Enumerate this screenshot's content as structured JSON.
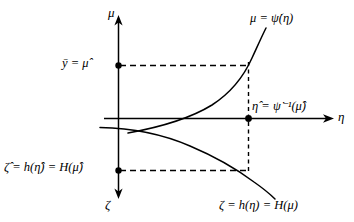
{
  "figure": {
    "background_color": "#ffffff",
    "line_color": "#000000"
  },
  "axes": {
    "vertical_up": {
      "label": "μ",
      "name": "mu-axis",
      "direction": "up"
    },
    "horizontal_right": {
      "label": "η",
      "name": "eta-axis",
      "direction": "right"
    },
    "vertical_down": {
      "label": "ζ",
      "name": "zeta-axis",
      "direction": "down"
    }
  },
  "curves": [
    {
      "name": "upper-curve",
      "label": "μ = ψ̇(η)",
      "description": "increasing convex curve in upper half plane"
    },
    {
      "name": "lower-curve",
      "label": "ζ = h(η) = H(μ)",
      "description": "decreasing concave curve in lower half plane"
    }
  ],
  "annotations": {
    "mu_hat_tick": "ȳ = μ̂",
    "eta_hat_point": "η̂ = ψ̇⁻¹(μ̂)",
    "zeta_hat_tick": "ζ̂ = h(η̂) = H(μ̂)"
  },
  "markers": [
    {
      "name": "mu-hat-marker",
      "x": 118,
      "y": 65
    },
    {
      "name": "eta-hat-marker",
      "x": 248,
      "y": 118
    },
    {
      "name": "zeta-hat-marker",
      "x": 118,
      "y": 170
    }
  ],
  "guide_lines": [
    {
      "name": "upper-horizontal-dashed",
      "from": [
        118,
        65
      ],
      "to": [
        248,
        65
      ]
    },
    {
      "name": "lower-horizontal-dashed",
      "from": [
        118,
        170
      ],
      "to": [
        248,
        170
      ]
    },
    {
      "name": "vertical-dashed",
      "from": [
        248,
        65
      ],
      "to": [
        248,
        170
      ]
    }
  ]
}
